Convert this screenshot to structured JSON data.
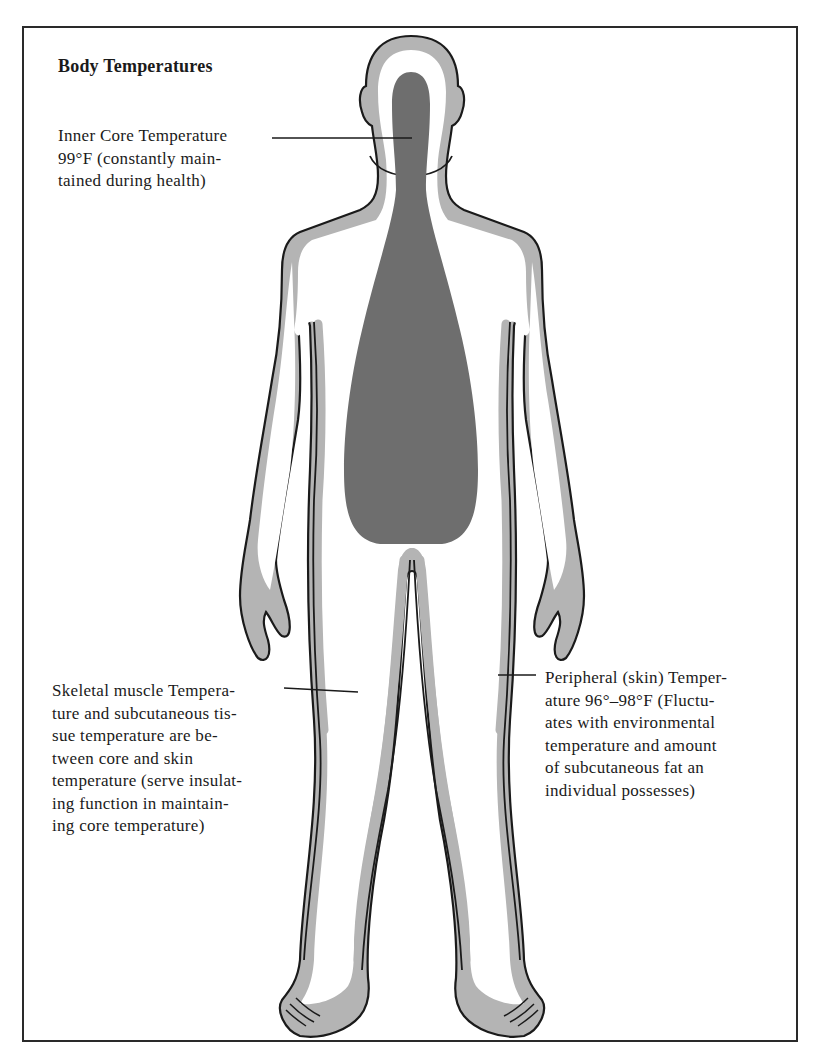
{
  "title": "Body Temperatures",
  "labels": {
    "core": {
      "lines": [
        "Inner Core Temperature",
        "99°F (constantly main-",
        "tained during health)"
      ],
      "temperature": "99°F"
    },
    "muscle": {
      "lines": [
        "Skeletal muscle Tempera-",
        "ture and subcutaneous tis-",
        "sue temperature are be-",
        "tween core and skin",
        "temperature (serve insulat-",
        "ing function in maintain-",
        "ing core temperature)"
      ]
    },
    "skin": {
      "lines": [
        "Peripheral (skin) Temper-",
        "ature 96°–98°F (Fluctu-",
        "ates with environmental",
        "temperature and amount",
        "of subcutaneous fat an",
        "individual possesses)"
      ],
      "temperature": "96°–98°F"
    }
  },
  "colors": {
    "core_fill": "#6e6e6e",
    "skin_band": "#b4b4b4",
    "muscle_fill": "#ffffff",
    "outline": "#1a1a1a"
  }
}
